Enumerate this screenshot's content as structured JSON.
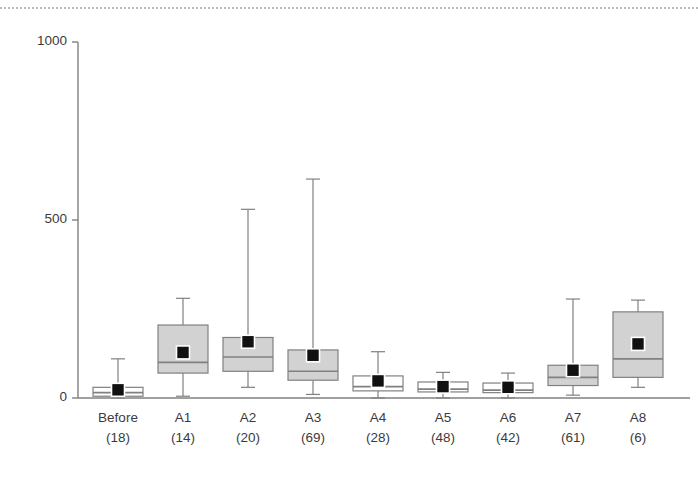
{
  "chart_data": {
    "type": "box",
    "title": "",
    "xlabel": "",
    "ylabel": "",
    "ylim": [
      0,
      1000
    ],
    "yticks": [
      0,
      500,
      1000
    ],
    "ytick_labels": [
      "0",
      "500",
      "1000"
    ],
    "grid": false,
    "legend": null,
    "categories": [
      "Before",
      "A1",
      "A2",
      "A3",
      "A4",
      "A5",
      "A6",
      "A7",
      "A8"
    ],
    "counts": [
      18,
      14,
      20,
      69,
      28,
      48,
      42,
      61,
      6
    ],
    "count_labels": [
      "(18)",
      "(14)",
      "(20)",
      "(69)",
      "(28)",
      "(48)",
      "(42)",
      "(61)",
      "(6)"
    ],
    "boxes": [
      {
        "category": "Before",
        "n": 18,
        "whisker_low": 0,
        "q1": 5,
        "median": 15,
        "q3": 30,
        "whisker_high": 110,
        "mean": 23,
        "fill": "white"
      },
      {
        "category": "A1",
        "n": 14,
        "whisker_low": 5,
        "q1": 70,
        "median": 100,
        "q3": 205,
        "whisker_high": 280,
        "mean": 128,
        "fill": "gray"
      },
      {
        "category": "A2",
        "n": 20,
        "whisker_low": 30,
        "q1": 75,
        "median": 115,
        "q3": 170,
        "whisker_high": 530,
        "mean": 158,
        "fill": "gray"
      },
      {
        "category": "A3",
        "n": 69,
        "whisker_low": 10,
        "q1": 50,
        "median": 75,
        "q3": 135,
        "whisker_high": 615,
        "mean": 120,
        "fill": "gray"
      },
      {
        "category": "A4",
        "n": 28,
        "whisker_low": 0,
        "q1": 20,
        "median": 32,
        "q3": 62,
        "whisker_high": 130,
        "mean": 48,
        "fill": "white"
      },
      {
        "category": "A5",
        "n": 48,
        "whisker_low": 0,
        "q1": 17,
        "median": 25,
        "q3": 45,
        "whisker_high": 72,
        "mean": 32,
        "fill": "white"
      },
      {
        "category": "A6",
        "n": 42,
        "whisker_low": 0,
        "q1": 15,
        "median": 22,
        "q3": 42,
        "whisker_high": 70,
        "mean": 30,
        "fill": "white"
      },
      {
        "category": "A7",
        "n": 61,
        "whisker_low": 8,
        "q1": 35,
        "median": 58,
        "q3": 92,
        "whisker_high": 278,
        "mean": 78,
        "fill": "gray"
      },
      {
        "category": "A8",
        "n": 6,
        "whisker_low": 30,
        "q1": 58,
        "median": 110,
        "q3": 242,
        "whisker_high": 275,
        "mean": 152,
        "fill": "gray"
      }
    ]
  },
  "style": {
    "axis_color": "#808080",
    "box_line_color": "#808080",
    "box_fill_gray": "#d2d2d2",
    "box_fill_white": "#ffffff",
    "mean_marker_color": "#111111",
    "text_color": "#3b3b3b",
    "dotted_rule_color": "#b9b9c4",
    "background": "#ffffff"
  }
}
